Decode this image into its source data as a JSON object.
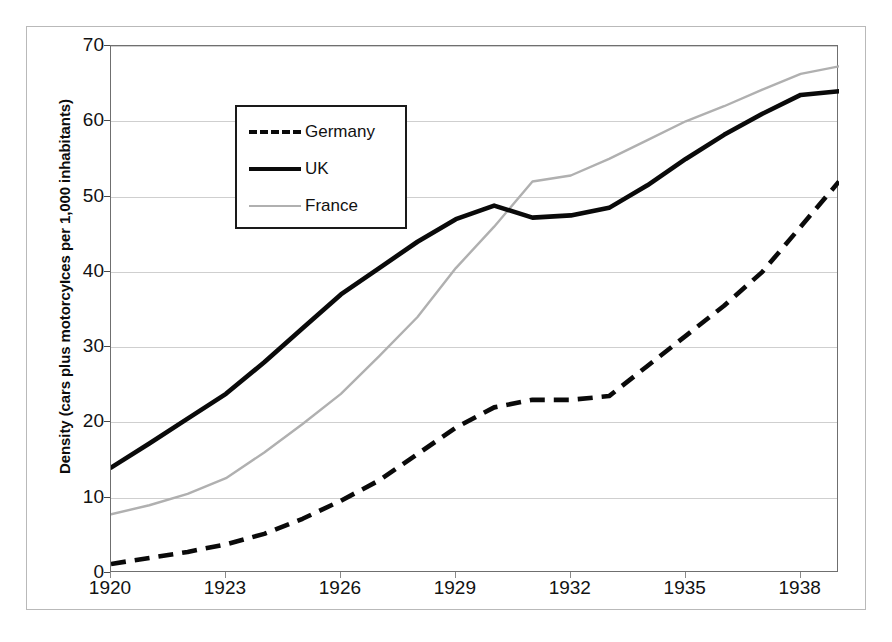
{
  "chart_data": {
    "type": "line",
    "title": "",
    "xlabel": "",
    "ylabel": "Density (cars plus motorcyIces per 1,000 inhabitants)",
    "xlim": [
      1920,
      1939
    ],
    "ylim": [
      0,
      70
    ],
    "y_ticks": [
      0,
      10,
      20,
      30,
      40,
      50,
      60,
      70
    ],
    "x_ticks": [
      1920,
      1923,
      1926,
      1929,
      1932,
      1935,
      1938
    ],
    "x": [
      1920,
      1921,
      1922,
      1923,
      1924,
      1925,
      1926,
      1927,
      1928,
      1929,
      1930,
      1931,
      1932,
      1933,
      1934,
      1935,
      1936,
      1937,
      1938,
      1939
    ],
    "grid": true,
    "legend_position": "upper-left",
    "series": [
      {
        "name": "Germany",
        "style": "dashed",
        "color": "#0a0a0a",
        "values": [
          1.2,
          2.0,
          2.8,
          3.8,
          5.2,
          7.2,
          9.6,
          12.3,
          15.8,
          19.3,
          22.0,
          23.0,
          23.0,
          23.5,
          27.5,
          31.5,
          35.5,
          40.0,
          46.0,
          52.0
        ]
      },
      {
        "name": "UK",
        "style": "solid",
        "color": "#0a0a0a",
        "values": [
          14.0,
          17.2,
          20.5,
          23.8,
          28.0,
          32.5,
          37.0,
          40.5,
          44.0,
          47.0,
          48.8,
          47.2,
          47.5,
          48.5,
          51.5,
          55.0,
          58.2,
          61.0,
          63.5,
          64.0
        ]
      },
      {
        "name": "France",
        "style": "thin",
        "color": "#b0b0b0",
        "values": [
          7.8,
          9.0,
          10.5,
          12.6,
          16.0,
          19.8,
          23.8,
          28.8,
          34.0,
          40.5,
          46.0,
          52.0,
          52.8,
          55.0,
          57.5,
          60.0,
          62.0,
          64.2,
          66.3,
          67.3
        ]
      }
    ]
  },
  "legend": {
    "items": [
      {
        "label": "Germany",
        "style": "dashed"
      },
      {
        "label": "UK",
        "style": "solid"
      },
      {
        "label": "France",
        "style": "thin"
      }
    ]
  },
  "axes": {
    "y_title": "Density (cars plus motorcyIces per 1,000 inhabitants)",
    "y_tick_labels": [
      "70",
      "60",
      "50",
      "40",
      "30",
      "20",
      "10",
      "0"
    ],
    "x_tick_labels": [
      "1920",
      "1923",
      "1926",
      "1929",
      "1932",
      "1935",
      "1938"
    ]
  },
  "colors": {
    "germany": "#0a0a0a",
    "uk": "#0a0a0a",
    "france": "#b0b0b0",
    "grid": "#cfcfcf",
    "axis": "#6f6f6f",
    "background": "#ffffff"
  }
}
